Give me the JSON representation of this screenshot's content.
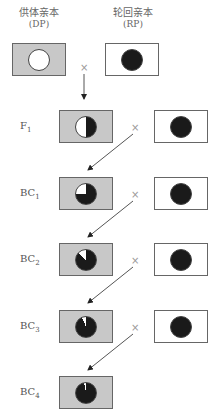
{
  "parents": {
    "donor": {
      "name": "供体亲本",
      "abbr": "(DP)"
    },
    "recurrent": {
      "name": "轮回亲本",
      "abbr": "(RP)"
    }
  },
  "cross_symbol": "×",
  "generations": [
    {
      "label": "F",
      "sub": "1",
      "donor_fraction": 0.5
    },
    {
      "label": "BC",
      "sub": "1",
      "donor_fraction": 0.25
    },
    {
      "label": "BC",
      "sub": "2",
      "donor_fraction": 0.125
    },
    {
      "label": "BC",
      "sub": "3",
      "donor_fraction": 0.0625
    },
    {
      "label": "BC",
      "sub": "4",
      "donor_fraction": 0.03125
    }
  ],
  "colors": {
    "gray_box": "#c8c8c8",
    "dark_genome": "#1a1a1a",
    "donor_genome": "#ffffff"
  }
}
